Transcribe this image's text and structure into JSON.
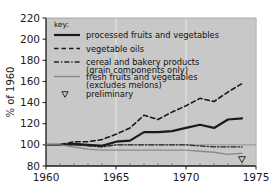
{
  "chart_data": {
    "type": "line",
    "title": "",
    "xlabel": "",
    "ylabel": "% of 1960",
    "xlim": [
      1960,
      1975
    ],
    "ylim": [
      80,
      220
    ],
    "ytick_values": [
      80,
      100,
      120,
      140,
      160,
      180,
      200,
      220
    ],
    "ytick_labels": [
      "80",
      "100",
      "120",
      "140",
      "160",
      "180",
      "200",
      "220"
    ],
    "xtick_values": [
      1960,
      1965,
      1970,
      1975
    ],
    "xtick_labels": [
      "1960",
      "1965",
      "1970",
      "1975"
    ],
    "minor_xticks": [
      1961,
      1962,
      1963,
      1964,
      1966,
      1967,
      1968,
      1969,
      1971,
      1972,
      1973,
      1974
    ],
    "grid": "vertical-major-only",
    "plot_background": "#c8c8c8",
    "legend_position": "upper-left-inside",
    "legend_title": "key:",
    "baseline_value": 100,
    "x": [
      1960,
      1961,
      1962,
      1963,
      1964,
      1965,
      1966,
      1967,
      1968,
      1969,
      1970,
      1971,
      1972,
      1973,
      1974
    ],
    "series": [
      {
        "name": "processed fruits and vegetables",
        "style": "solid",
        "color": "#1a1a1a",
        "width": 2.2,
        "values": [
          100,
          100,
          101,
          100,
          99,
          103,
          104,
          112,
          112,
          113,
          116,
          119,
          116,
          124,
          125
        ]
      },
      {
        "name": "vegetable oils",
        "style": "dashed",
        "color": "#1a1a1a",
        "width": 1.6,
        "values": [
          100,
          100,
          103,
          103,
          105,
          110,
          116,
          128,
          124,
          131,
          137,
          144,
          141,
          150,
          158
        ]
      },
      {
        "name": "cereal and bakery products (grain components only)",
        "style": "dashdot",
        "color": "#222222",
        "width": 1.3,
        "values": [
          100,
          100,
          100,
          99,
          98,
          100,
          100,
          100,
          100,
          100,
          100,
          99,
          98,
          98,
          98
        ]
      },
      {
        "name": "fresh fruits and vegetables (excludes melons)",
        "style": "solid-light",
        "color": "#8a8a8a",
        "width": 1.4,
        "values": [
          100,
          100,
          98,
          96,
          95,
          95,
          95,
          95,
          95,
          95,
          95,
          94,
          93,
          91,
          92
        ]
      }
    ],
    "annotations": [
      {
        "name": "preliminary-marker",
        "marker": "triangle-down-open",
        "x": 1974,
        "y": 86
      }
    ]
  },
  "legend": {
    "title": "key:",
    "entries": [
      {
        "label": "processed fruits and vegetables",
        "sublabel": "",
        "swatch": "solid"
      },
      {
        "label": "vegetable oils",
        "sublabel": "",
        "swatch": "dashed"
      },
      {
        "label": "cereal and bakery products",
        "sublabel": "(grain components only)",
        "swatch": "dashdot"
      },
      {
        "label": "fresh fruits and vegetables",
        "sublabel": "(excludes melons)",
        "swatch": "solid-light"
      },
      {
        "label": "preliminary",
        "sublabel": "",
        "swatch": "triangle"
      }
    ]
  }
}
